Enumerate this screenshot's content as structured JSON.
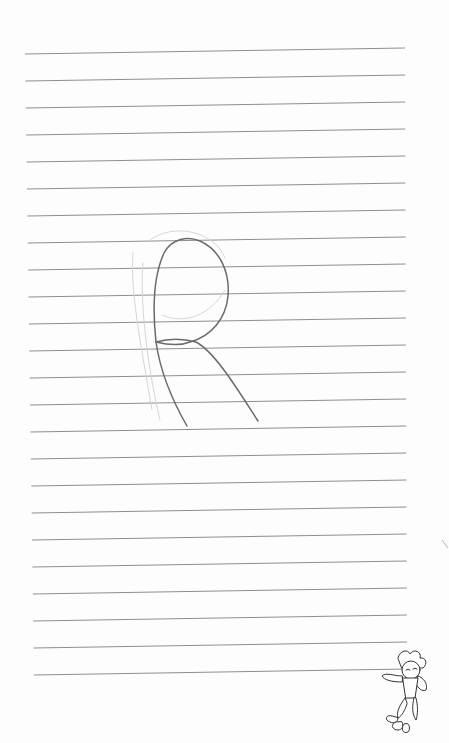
{
  "page": {
    "type": "lined-notebook-page",
    "background_color": "#fdfdfd",
    "line_color": "#8e8e8e",
    "stroke_color": "#6e6e6e",
    "faint_stroke_color": "#d4d4d4",
    "ruled_lines": {
      "count": 24,
      "left_x_start": 25,
      "left_x_end": 34,
      "right_x": 405,
      "first_y_left": 54,
      "spacing": 27,
      "slope_rise_px": 6
    }
  },
  "handwriting": {
    "letter": "R",
    "description": "Hand-drawn capital letter R in pencil"
  },
  "illustration": {
    "name": "cartoon-character-mascot",
    "position": "bottom-right"
  }
}
